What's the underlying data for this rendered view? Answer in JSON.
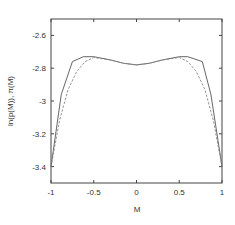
{
  "chart_data": {
    "type": "line",
    "title": "",
    "xlabel": "M",
    "ylabel": "ln(p(M)), π(M)",
    "xlim": [
      -1,
      1
    ],
    "ylim": [
      -3.5,
      -2.5
    ],
    "x_ticks": [
      -1,
      -0.5,
      0,
      0.5,
      1
    ],
    "x_tick_labels": [
      "-1",
      "-0.5",
      "0",
      "0.5",
      "1"
    ],
    "y_ticks": [
      -2.6,
      -2.8,
      -3,
      -3.2,
      -3.4
    ],
    "y_tick_labels": [
      "-2.6",
      "-2.8",
      "-3",
      "-3.2",
      "-3.4"
    ],
    "grid": false,
    "legend": null,
    "series": [
      {
        "name": "ln(p(M))",
        "style": "solid",
        "color": "#555555",
        "x": [
          -1,
          -0.88,
          -0.75,
          -0.62,
          -0.5,
          -0.3,
          -0.15,
          0,
          0.15,
          0.3,
          0.5,
          0.6,
          0.77,
          0.87,
          1
        ],
        "y": [
          -3.4,
          -2.96,
          -2.76,
          -2.73,
          -2.73,
          -2.75,
          -2.77,
          -2.78,
          -2.77,
          -2.75,
          -2.73,
          -2.73,
          -2.76,
          -2.96,
          -3.4
        ]
      },
      {
        "name": "π(M)",
        "style": "dashed",
        "color": "#888888",
        "x": [
          -1,
          -0.9,
          -0.8,
          -0.7,
          -0.6,
          -0.5,
          -0.3,
          -0.15,
          0,
          0.15,
          0.3,
          0.5,
          0.6,
          0.7,
          0.8,
          0.9,
          1
        ],
        "y": [
          -3.4,
          -3.12,
          -2.93,
          -2.82,
          -2.76,
          -2.735,
          -2.75,
          -2.77,
          -2.78,
          -2.77,
          -2.75,
          -2.735,
          -2.76,
          -2.82,
          -2.93,
          -3.12,
          -3.4
        ]
      }
    ]
  }
}
